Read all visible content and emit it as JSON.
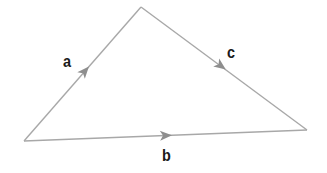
{
  "diagram": {
    "type": "vector-triangle",
    "colors": {
      "edge": "#a8a8a8",
      "arrow": "#8e8e8e",
      "label": "#1a1a1a",
      "background": "#ffffff"
    },
    "vertices": {
      "bottom_left": [
        24,
        141
      ],
      "top": [
        141,
        7
      ],
      "right": [
        307,
        130
      ]
    },
    "edges": [
      {
        "id": "a",
        "label": "a",
        "from": "bottom_left",
        "to": "top"
      },
      {
        "id": "c",
        "label": "c",
        "from": "top",
        "to": "right"
      },
      {
        "id": "b",
        "label": "b",
        "from": "bottom_left",
        "to": "right"
      }
    ],
    "labels": {
      "a": "a",
      "b": "b",
      "c": "c"
    }
  }
}
